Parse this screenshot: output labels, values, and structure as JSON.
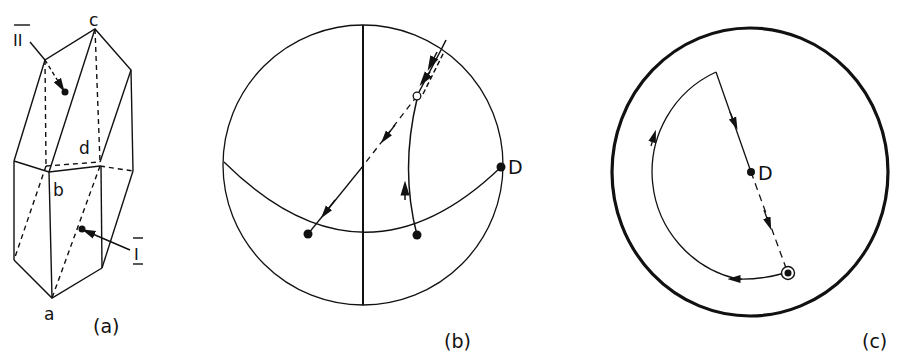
{
  "panels": {
    "a": {
      "caption": "(a)",
      "vertex_labels": {
        "a": "a",
        "b": "b",
        "c": "c",
        "d": "d"
      },
      "face_labels": {
        "one": "I",
        "two": "II"
      }
    },
    "b": {
      "caption": "(b)",
      "point_label": "D"
    },
    "c": {
      "caption": "(c)",
      "point_label": "D"
    }
  },
  "colors": {
    "ink": "#111111",
    "background": "#ffffff"
  }
}
